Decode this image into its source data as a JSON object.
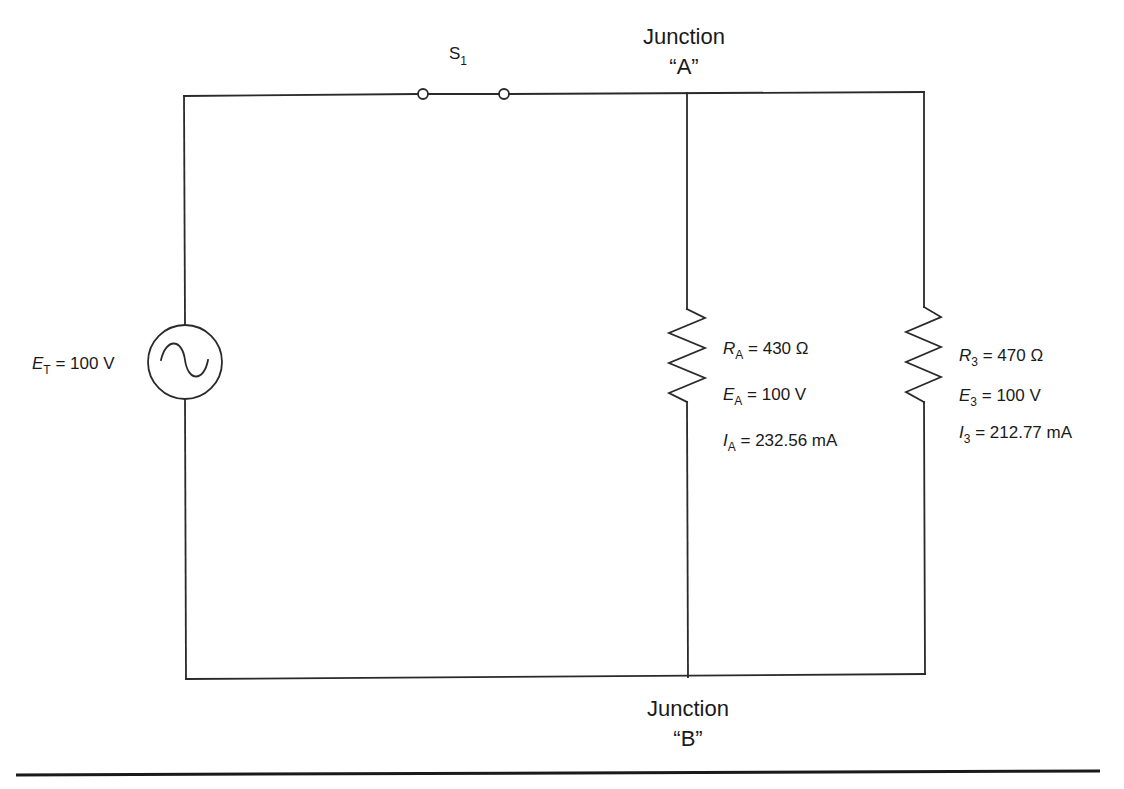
{
  "switch": {
    "symbol": "S",
    "subscript": "1"
  },
  "junctions": {
    "a": {
      "line1": "Junction",
      "line2": "“A”"
    },
    "b": {
      "line1": "Junction",
      "line2": "“B”"
    }
  },
  "source": {
    "icon": "ac-sine-source-icon",
    "symbol": "E",
    "subscript": "T",
    "value": "= 100 V"
  },
  "branch_a": {
    "resistance": {
      "symbol": "R",
      "subscript": "A",
      "value": "= 430 Ω"
    },
    "voltage": {
      "symbol": "E",
      "subscript": "A",
      "value": "= 100 V"
    },
    "current": {
      "symbol": "I",
      "subscript": "A",
      "value": "= 232.56 mA"
    }
  },
  "branch_3": {
    "resistance": {
      "symbol": "R",
      "subscript": "3",
      "value": "= 470 Ω"
    },
    "voltage": {
      "symbol": "E",
      "subscript": "3",
      "value": "= 100 V"
    },
    "current": {
      "symbol": "I",
      "subscript": "3",
      "value": "= 212.77 mA"
    }
  },
  "colors": {
    "line": "#2a2a2a",
    "background": "#ffffff"
  }
}
